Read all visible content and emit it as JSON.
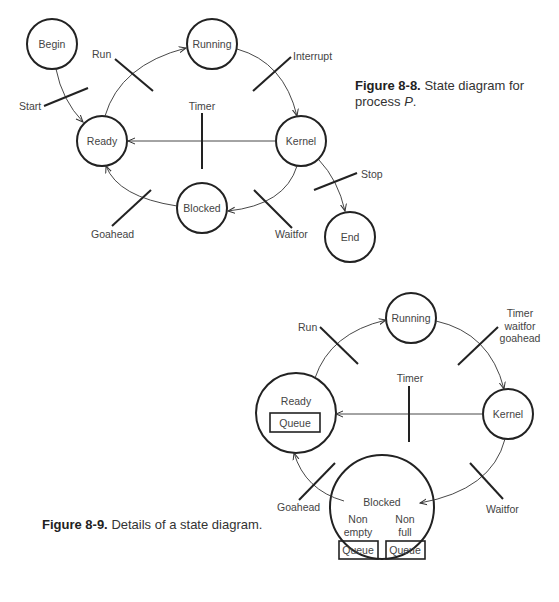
{
  "figure_8_8": {
    "caption_number": "Figure 8-8.",
    "caption_text": "State diagram for",
    "caption_text_2": "process ",
    "caption_italic": "P",
    "caption_end": ".",
    "states": {
      "begin": "Begin",
      "running": "Running",
      "ready": "Ready",
      "kernel": "Kernel",
      "blocked": "Blocked",
      "end": "End"
    },
    "transitions": {
      "start": "Start",
      "run": "Run",
      "interrupt": "Interrupt",
      "timer": "Timer",
      "stop": "Stop",
      "waitfor": "Waitfor",
      "goahead": "Goahead"
    }
  },
  "figure_8_9": {
    "caption_number": "Figure 8-9.",
    "caption_text": "Details of a state diagram.",
    "states": {
      "running": "Running",
      "ready": "Ready",
      "ready_queue": "Queue",
      "kernel": "Kernel",
      "blocked": "Blocked",
      "nonempty_1": "Non",
      "nonempty_2": "empty",
      "nonfull_1": "Non",
      "nonfull_2": "full",
      "queue_left": "Queue",
      "queue_right": "Queue"
    },
    "transitions": {
      "run": "Run",
      "timer_waitfor_goahead_1": "Timer",
      "timer_waitfor_goahead_2": "waitfor",
      "timer_waitfor_goahead_3": "goahead",
      "timer": "Timer",
      "waitfor": "Waitfor",
      "goahead": "Goahead"
    }
  },
  "colors": {
    "ink": "#222222",
    "text": "#444444",
    "background": "#ffffff"
  }
}
